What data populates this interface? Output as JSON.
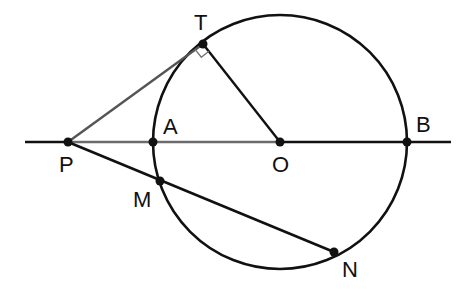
{
  "diagram": {
    "type": "geometry",
    "colors": {
      "stroke": "#111111",
      "gray_stroke": "#6b6b6b",
      "background": "#ffffff"
    },
    "circle": {
      "center": "O",
      "cx": 280,
      "cy": 142,
      "r": 127
    },
    "points": [
      {
        "name": "T",
        "label": "T",
        "x": 203,
        "y": 44,
        "label_x": 194,
        "label_y": 30
      },
      {
        "name": "P",
        "label": "P",
        "x": 68,
        "y": 142,
        "label_x": 59,
        "label_y": 172
      },
      {
        "name": "A",
        "label": "A",
        "x": 153,
        "y": 142,
        "label_x": 163,
        "label_y": 134
      },
      {
        "name": "O",
        "label": "O",
        "x": 280,
        "y": 142,
        "label_x": 272,
        "label_y": 172
      },
      {
        "name": "B",
        "label": "B",
        "x": 407,
        "y": 142,
        "label_x": 416,
        "label_y": 132
      },
      {
        "name": "M",
        "label": "M",
        "x": 160,
        "y": 181,
        "label_x": 133,
        "label_y": 207
      },
      {
        "name": "N",
        "label": "N",
        "x": 334,
        "y": 252,
        "label_x": 342,
        "label_y": 277
      }
    ],
    "segments": [
      {
        "name": "line-PB",
        "from": "left-end",
        "to": "right-end"
      },
      {
        "name": "tangent-PT",
        "from": "P",
        "to": "T"
      },
      {
        "name": "radius-OT",
        "from": "O",
        "to": "T"
      },
      {
        "name": "secant-PN",
        "from": "P",
        "to": "N"
      }
    ],
    "annotations": [
      {
        "name": "right-angle-marker",
        "at": "T"
      }
    ]
  }
}
